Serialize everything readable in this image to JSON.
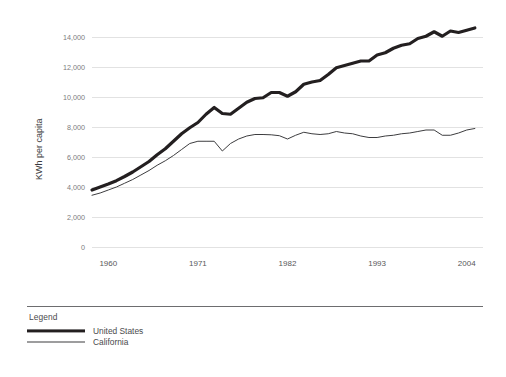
{
  "chart_data": {
    "type": "line",
    "title": "",
    "subtitle": "",
    "xlabel": "",
    "ylabel": "KWh per capita",
    "xlim": [
      1958,
      2006
    ],
    "ylim": [
      0,
      15000
    ],
    "grid": true,
    "legend_position": "bottom-left",
    "legend_title": "Legend",
    "y_ticks": [
      "0",
      "2,000",
      "4,000",
      "6,000",
      "8,000",
      "10,000",
      "12,000",
      "14,000"
    ],
    "y_tick_values": [
      0,
      2000,
      4000,
      6000,
      8000,
      10000,
      12000,
      14000
    ],
    "x_ticks": [
      "1960",
      "1971",
      "1982",
      "1993",
      "2004"
    ],
    "x_tick_values": [
      1960,
      1971,
      1982,
      1993,
      2004
    ],
    "x": [
      1958,
      1959,
      1960,
      1961,
      1962,
      1963,
      1964,
      1965,
      1966,
      1967,
      1968,
      1969,
      1970,
      1971,
      1972,
      1973,
      1974,
      1975,
      1976,
      1977,
      1978,
      1979,
      1980,
      1981,
      1982,
      1983,
      1984,
      1985,
      1986,
      1987,
      1988,
      1989,
      1990,
      1991,
      1992,
      1993,
      1994,
      1995,
      1996,
      1997,
      1998,
      1999,
      2000,
      2001,
      2002,
      2003,
      2004,
      2005
    ],
    "series": [
      {
        "name": "United States",
        "color": "#231f20",
        "line_width": "thick",
        "values": [
          3800,
          4000,
          4200,
          4420,
          4700,
          5000,
          5350,
          5700,
          6150,
          6550,
          7050,
          7550,
          7950,
          8300,
          8850,
          9300,
          8900,
          8850,
          9250,
          9650,
          9900,
          9950,
          10300,
          10300,
          10050,
          10350,
          10850,
          11000,
          11100,
          11500,
          11950,
          12100,
          12250,
          12400,
          12400,
          12800,
          12950,
          13250,
          13450,
          13550,
          13900,
          14050,
          14350,
          14050,
          14400,
          14300,
          14450,
          14600
        ]
      },
      {
        "name": "California",
        "color": "#3d3d3f",
        "line_width": "thin",
        "values": [
          3450,
          3600,
          3800,
          4000,
          4250,
          4500,
          4800,
          5100,
          5450,
          5750,
          6100,
          6500,
          6900,
          7050,
          7050,
          7050,
          6400,
          6900,
          7200,
          7400,
          7500,
          7500,
          7480,
          7420,
          7200,
          7450,
          7650,
          7550,
          7500,
          7550,
          7700,
          7600,
          7550,
          7400,
          7300,
          7300,
          7400,
          7450,
          7550,
          7600,
          7700,
          7800,
          7800,
          7450,
          7450,
          7600,
          7800,
          7900
        ]
      }
    ]
  },
  "legend": {
    "title": "Legend",
    "items": [
      {
        "label": "United States",
        "swatch": "thick-line-swatch"
      },
      {
        "label": "California",
        "swatch": "thin-line-swatch"
      }
    ]
  },
  "axes": {
    "y_title": "KWh per capita"
  }
}
